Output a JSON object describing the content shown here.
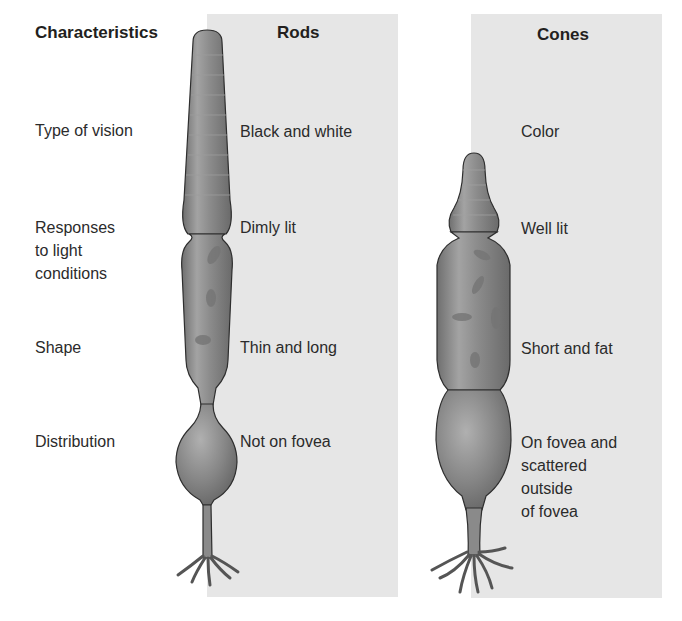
{
  "headers": {
    "characteristics": "Characteristics",
    "rods": "Rods",
    "cones": "Cones"
  },
  "rows": [
    {
      "characteristic": "Type of vision",
      "rods": "Black and white",
      "cones": "Color"
    },
    {
      "characteristic": "Responses\nto light\nconditions",
      "rods": "Dimly lit",
      "cones": "Well lit"
    },
    {
      "characteristic": "Shape",
      "rods": "Thin and long",
      "cones": "Short and fat"
    },
    {
      "characteristic": "Distribution",
      "rods": "Not on fovea",
      "cones": "On fovea and\nscattered\noutside\nof fovea"
    }
  ],
  "colors": {
    "panel": "#e6e6e6",
    "cell_fill": "#8a8a8a",
    "cell_outline": "#2e2e2e"
  }
}
